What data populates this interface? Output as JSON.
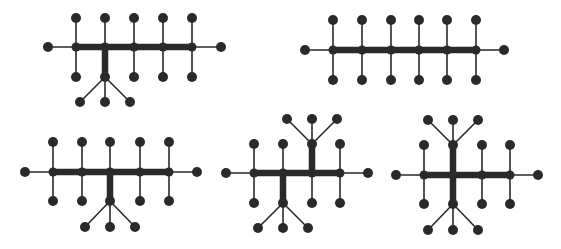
{
  "figure": {
    "width": 561,
    "height": 249,
    "background": "#ffffff",
    "ink": "#2a2a2a",
    "node_radius": 5,
    "graphs": [
      {
        "id": "graph-1",
        "backbone_y": 47,
        "left_end": 48,
        "right_end": 221,
        "junctions": [
          76,
          105,
          134,
          163,
          192
        ],
        "top_y": 18,
        "bottom_y": 77,
        "branches": [
          {
            "x": 105,
            "dir": "down",
            "junction_y": 77,
            "leaf_y": 102,
            "leaves_x": [
              80,
              105,
              130
            ]
          }
        ]
      },
      {
        "id": "graph-2",
        "backbone_y": 50,
        "left_end": 305,
        "right_end": 504,
        "junctions": [
          333,
          362,
          391,
          419,
          447,
          476
        ],
        "top_y": 20,
        "bottom_y": 80,
        "branches": []
      },
      {
        "id": "graph-3",
        "backbone_y": 172,
        "left_end": 25,
        "right_end": 197,
        "junctions": [
          53,
          82,
          110,
          140,
          169
        ],
        "top_y": 142,
        "bottom_y": 201,
        "branches": [
          {
            "x": 110,
            "dir": "down",
            "junction_y": 201,
            "leaf_y": 227,
            "leaves_x": [
              85,
              110,
              135
            ]
          }
        ]
      },
      {
        "id": "graph-4",
        "backbone_y": 173,
        "left_end": 226,
        "right_end": 368,
        "junctions": [
          254,
          283,
          312,
          340
        ],
        "top_y": 144,
        "bottom_y": 203,
        "branches": [
          {
            "x": 283,
            "dir": "down",
            "junction_y": 203,
            "leaf_y": 228,
            "leaves_x": [
              258,
              283,
              308
            ]
          },
          {
            "x": 312,
            "dir": "up",
            "junction_y": 144,
            "leaf_y": 119,
            "leaves_x": [
              287,
              312,
              337
            ]
          }
        ]
      },
      {
        "id": "graph-5",
        "backbone_y": 175,
        "left_end": 396,
        "right_end": 538,
        "junctions": [
          424,
          453,
          482,
          510
        ],
        "top_y": 145,
        "bottom_y": 204,
        "branches": [
          {
            "x": 453,
            "dir": "up",
            "junction_y": 145,
            "leaf_y": 120,
            "leaves_x": [
              428,
              453,
              478
            ]
          },
          {
            "x": 453,
            "dir": "down",
            "junction_y": 204,
            "leaf_y": 230,
            "leaves_x": [
              428,
              453,
              478
            ]
          }
        ]
      }
    ]
  }
}
